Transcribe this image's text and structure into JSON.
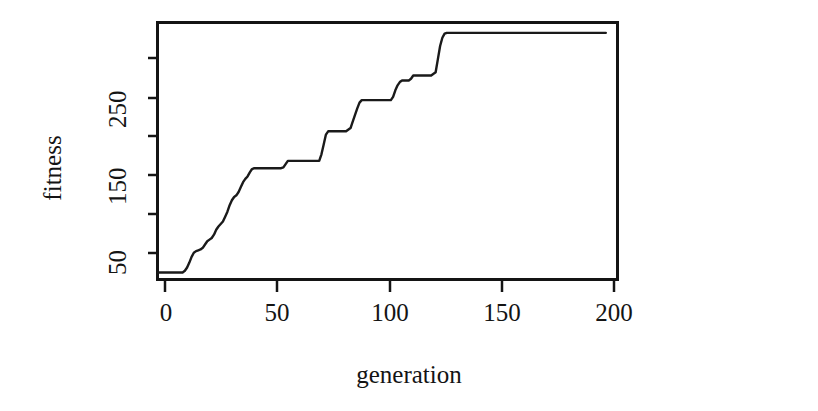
{
  "chart_data": {
    "type": "line",
    "title": "",
    "subtitle": "",
    "xlabel": "generation",
    "ylabel": "fitness",
    "xlim": [
      0,
      205
    ],
    "ylim": [
      28,
      340
    ],
    "grid": false,
    "legend": null,
    "annotations": [],
    "x_ticks": [
      {
        "value": 0,
        "label": "0"
      },
      {
        "value": 50,
        "label": "50"
      },
      {
        "value": 100,
        "label": "100"
      },
      {
        "value": 150,
        "label": "150"
      },
      {
        "value": 200,
        "label": "200"
      }
    ],
    "y_ticks": [
      {
        "value": 50,
        "label": "50"
      },
      {
        "value": 100,
        "label": ""
      },
      {
        "value": 150,
        "label": "150"
      },
      {
        "value": 200,
        "label": ""
      },
      {
        "value": 250,
        "label": "250"
      },
      {
        "value": 300,
        "label": ""
      }
    ],
    "series": [
      {
        "name": "best fitness",
        "color": "#1a1a1a",
        "line_width": 2,
        "x": [
          0,
          4,
          8,
          11,
          12,
          13,
          14,
          15,
          16,
          17,
          18,
          19,
          20,
          21,
          22,
          23,
          24,
          25,
          26,
          27,
          28,
          29,
          30,
          31,
          32,
          33,
          34,
          35,
          36,
          37,
          38,
          39,
          40,
          41,
          42,
          43,
          44,
          45,
          50,
          55,
          56,
          57,
          58,
          62,
          68,
          72,
          73,
          74,
          75,
          76,
          80,
          84,
          86,
          87,
          88,
          89,
          90,
          91,
          95,
          100,
          104,
          105,
          106,
          107,
          108,
          109,
          110,
          111,
          112,
          113,
          114,
          118,
          122,
          124,
          125,
          126,
          127,
          128,
          129,
          135,
          145,
          160,
          175,
          190,
          200
        ],
        "y": [
          36,
          36,
          36,
          36,
          38,
          42,
          48,
          55,
          60,
          62,
          63,
          64,
          66,
          70,
          74,
          76,
          78,
          82,
          88,
          92,
          95,
          98,
          104,
          110,
          118,
          124,
          128,
          130,
          134,
          140,
          146,
          150,
          153,
          158,
          162,
          163,
          163,
          163,
          163,
          163,
          164,
          168,
          172,
          172,
          172,
          172,
          180,
          192,
          204,
          208,
          208,
          208,
          212,
          220,
          228,
          236,
          243,
          246,
          246,
          246,
          246,
          250,
          258,
          264,
          268,
          270,
          270,
          270,
          270,
          272,
          276,
          276,
          276,
          280,
          296,
          312,
          322,
          327,
          328,
          328,
          328,
          328,
          328,
          328,
          328
        ]
      }
    ]
  },
  "axes": {
    "x_title": "generation",
    "y_title": "fitness"
  },
  "style": {
    "line_color": "#1a1a1a",
    "axis_color": "#141414",
    "background": "#ffffff"
  }
}
